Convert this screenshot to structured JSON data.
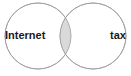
{
  "diagram": {
    "type": "venn",
    "title": "",
    "sets": [
      {
        "id": "left",
        "label": "Internet",
        "center_x": 38,
        "center_y": 36,
        "radius": 33,
        "fill": "#ffffff",
        "stroke": "#9a9a9a"
      },
      {
        "id": "right",
        "label": "tax",
        "center_x": 93,
        "center_y": 36,
        "radius": 33,
        "fill": "#ffffff",
        "stroke": "#9a9a9a"
      }
    ],
    "intersection": {
      "label": "",
      "fill": "#d9d9d9",
      "stroke": "#9a9a9a"
    },
    "background": "#ffffff",
    "stroke_color": "#9a9a9a",
    "stroke_width": 0.8,
    "label_color": "#1a1a1a"
  }
}
